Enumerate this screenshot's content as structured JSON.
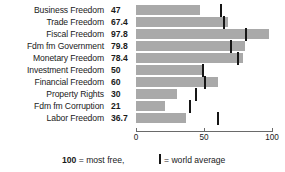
{
  "chart_data": {
    "type": "bar",
    "orientation": "horizontal",
    "title": "",
    "xlabel": "",
    "ylabel": "",
    "xlim": [
      0,
      100
    ],
    "ticks": [
      0,
      50,
      100
    ],
    "tick_labels": [
      "0",
      "50",
      "100"
    ],
    "grid": false,
    "legend_position": "bottom",
    "bar_color": "#a9a9a9",
    "marker_color": "#161616",
    "categories": [
      "Business Freedom",
      "Trade Freedom",
      "Fiscal Freedom",
      "Fdm fm Government",
      "Monetary Freedom",
      "Investment Freedom",
      "Financial Freedom",
      "Property Rights",
      "Fdm fm Corruption",
      "Labor Freedom"
    ],
    "values": [
      47,
      67.4,
      97.8,
      79.8,
      78.4,
      50,
      60,
      30,
      21,
      36.7
    ],
    "value_labels": [
      "47",
      "67.4",
      "97.8",
      "79.8",
      "78.4",
      "50",
      "60",
      "30",
      "21",
      "36.7"
    ],
    "series": [
      {
        "name": "Score",
        "values": [
          47,
          67.4,
          97.8,
          79.8,
          78.4,
          50,
          60,
          30,
          21,
          36.7
        ]
      },
      {
        "name": "World average",
        "marker": "vertical-line",
        "values": [
          62.5,
          65,
          81,
          70,
          75,
          49,
          51,
          44,
          40,
          60
        ]
      }
    ],
    "rows": [
      {
        "label": "Business Freedom",
        "value_label": "47",
        "value": 47,
        "world_average": 62.5
      },
      {
        "label": "Trade Freedom",
        "value_label": "67.4",
        "value": 67.4,
        "world_average": 65
      },
      {
        "label": "Fiscal Freedom",
        "value_label": "97.8",
        "value": 97.8,
        "world_average": 81
      },
      {
        "label": "Fdm fm Government",
        "value_label": "79.8",
        "value": 79.8,
        "world_average": 70
      },
      {
        "label": "Monetary Freedom",
        "value_label": "78.4",
        "value": 78.4,
        "world_average": 75
      },
      {
        "label": "Investment Freedom",
        "value_label": "50",
        "value": 50,
        "world_average": 49
      },
      {
        "label": "Financial Freedom",
        "value_label": "60",
        "value": 60,
        "world_average": 51
      },
      {
        "label": "Property Rights",
        "value_label": "30",
        "value": 30,
        "world_average": 44
      },
      {
        "label": "Fdm fm Corruption",
        "value_label": "21",
        "value": 21,
        "world_average": 40
      },
      {
        "label": "Labor Freedom",
        "value_label": "36.7",
        "value": 36.7,
        "world_average": 60
      }
    ],
    "annotations": {
      "scale_note_strong": "100",
      "scale_note_rest": " = most free,",
      "marker_note": "= world average"
    }
  }
}
